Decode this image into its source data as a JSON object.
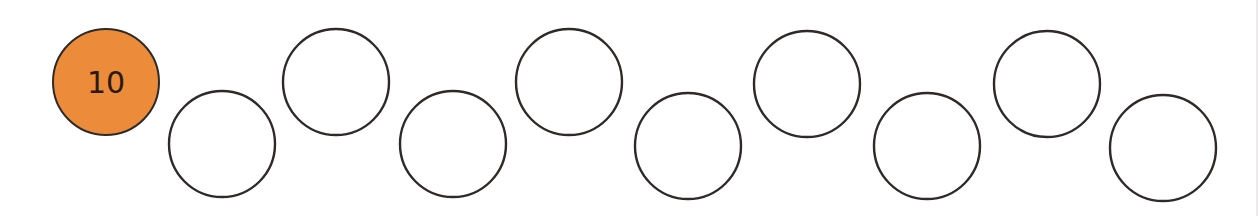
{
  "sequence": {
    "title": "",
    "circles": [
      {
        "label": "10",
        "filled": true
      },
      {
        "label": "",
        "filled": false
      },
      {
        "label": "",
        "filled": false
      },
      {
        "label": "",
        "filled": false
      },
      {
        "label": "",
        "filled": false
      },
      {
        "label": "",
        "filled": false
      },
      {
        "label": "",
        "filled": false
      },
      {
        "label": "",
        "filled": false
      },
      {
        "label": "",
        "filled": false
      },
      {
        "label": "",
        "filled": false
      }
    ]
  },
  "colors": {
    "filled": "#ec8b3a",
    "empty": "#ffffff",
    "stroke": "#2e2a28",
    "text": "#2a1a12"
  }
}
